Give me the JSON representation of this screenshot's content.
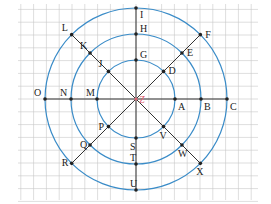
{
  "diagram": {
    "type": "concentric-circles-with-lines",
    "center": {
      "label": "Z",
      "x": 136,
      "y": 99
    },
    "grid": {
      "spacing": 12.8,
      "color": "#c8c8c8"
    },
    "circle_color": "#3a8cc8",
    "line_color": "#333333",
    "radii": [
      39,
      65,
      91
    ],
    "points": [
      {
        "label": "A",
        "angle": 0,
        "ring": 0
      },
      {
        "label": "B",
        "angle": 0,
        "ring": 1
      },
      {
        "label": "C",
        "angle": 0,
        "ring": 2
      },
      {
        "label": "D",
        "angle": 45,
        "ring": 0
      },
      {
        "label": "E",
        "angle": 45,
        "ring": 1
      },
      {
        "label": "F",
        "angle": 45,
        "ring": 2
      },
      {
        "label": "G",
        "angle": 90,
        "ring": 0
      },
      {
        "label": "H",
        "angle": 90,
        "ring": 1
      },
      {
        "label": "I",
        "angle": 90,
        "ring": 2
      },
      {
        "label": "J",
        "angle": 135,
        "ring": 0
      },
      {
        "label": "K",
        "angle": 135,
        "ring": 1
      },
      {
        "label": "L",
        "angle": 135,
        "ring": 2
      },
      {
        "label": "M",
        "angle": 180,
        "ring": 0
      },
      {
        "label": "N",
        "angle": 180,
        "ring": 1
      },
      {
        "label": "O",
        "angle": 180,
        "ring": 2
      },
      {
        "label": "P",
        "angle": 225,
        "ring": 0
      },
      {
        "label": "Q",
        "angle": 225,
        "ring": 1
      },
      {
        "label": "R",
        "angle": 225,
        "ring": 2
      },
      {
        "label": "S",
        "angle": 270,
        "ring": 0
      },
      {
        "label": "T",
        "angle": 270,
        "ring": 1
      },
      {
        "label": "U",
        "angle": 270,
        "ring": 2
      },
      {
        "label": "V",
        "angle": 315,
        "ring": 0
      },
      {
        "label": "W",
        "angle": 315,
        "ring": 1
      },
      {
        "label": "X",
        "angle": 315,
        "ring": 2
      }
    ]
  }
}
